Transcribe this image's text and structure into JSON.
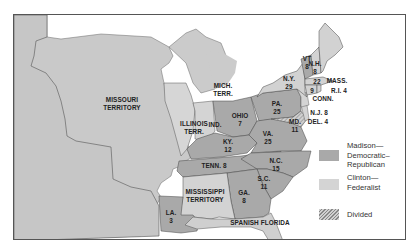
{
  "map": {
    "title": "Election of 1812",
    "colors": {
      "madison": "#a9a9a9",
      "clinton": "#d4d4d4",
      "territory": "#c8c8c8",
      "water": "#ffffff",
      "border": "#444444"
    },
    "territories": [
      {
        "id": "missouri",
        "name": "MISSOURI",
        "name2": "TERRITORY"
      },
      {
        "id": "illinois",
        "name": "ILLINOIS",
        "name2": "TERR."
      },
      {
        "id": "michigan",
        "name": "MICH.",
        "name2": "TERR."
      },
      {
        "id": "mississippi",
        "name": "MISSISSIPPI",
        "name2": "TERRITORY"
      },
      {
        "id": "spanish-florida",
        "name": "SPANISH FLORIDA",
        "name2": ""
      }
    ],
    "states": [
      {
        "id": "vt",
        "name": "VT",
        "votes": "8",
        "party": "Madison"
      },
      {
        "id": "nh",
        "name": "N.H.",
        "votes": "8",
        "party": "Clinton"
      },
      {
        "id": "mass",
        "name": "MASS.",
        "votes": "22",
        "party": "Clinton"
      },
      {
        "id": "ri",
        "name": "R.I. 4",
        "votes": "",
        "party": "Clinton"
      },
      {
        "id": "conn",
        "name": "CONN.",
        "votes": "9",
        "party": "Clinton"
      },
      {
        "id": "ny",
        "name": "N.Y.",
        "votes": "29",
        "party": "Clinton"
      },
      {
        "id": "nj",
        "name": "N.J. 8",
        "votes": "",
        "party": "Clinton"
      },
      {
        "id": "del",
        "name": "DEL. 4",
        "votes": "",
        "party": "Clinton"
      },
      {
        "id": "md",
        "name": "MD.",
        "votes": "11",
        "party": "Divided"
      },
      {
        "id": "pa",
        "name": "PA.",
        "votes": "25",
        "party": "Madison"
      },
      {
        "id": "ohio",
        "name": "OHIO",
        "votes": "7",
        "party": "Madison"
      },
      {
        "id": "ind",
        "name": "IND.",
        "votes": "",
        "party": "Territory"
      },
      {
        "id": "ky",
        "name": "KY.",
        "votes": "12",
        "party": "Madison"
      },
      {
        "id": "va",
        "name": "VA.",
        "votes": "25",
        "party": "Madison"
      },
      {
        "id": "tenn",
        "name": "TENN. 8",
        "votes": "",
        "party": "Madison"
      },
      {
        "id": "nc",
        "name": "N.C.",
        "votes": "15",
        "party": "Madison"
      },
      {
        "id": "sc",
        "name": "S.C.",
        "votes": "11",
        "party": "Madison"
      },
      {
        "id": "ga",
        "name": "GA.",
        "votes": "8",
        "party": "Madison"
      },
      {
        "id": "la",
        "name": "LA.",
        "votes": "3",
        "party": "Madison"
      }
    ]
  },
  "legend": {
    "items": [
      {
        "label_lines": [
          "Madison—",
          "Democratic–",
          "Republican"
        ],
        "swatch": "solid-dark"
      },
      {
        "label_lines": [
          "Clinton—",
          "Federalist"
        ],
        "swatch": "solid-light"
      },
      {
        "label_lines": [
          "Divided"
        ],
        "swatch": "hatched"
      }
    ]
  }
}
